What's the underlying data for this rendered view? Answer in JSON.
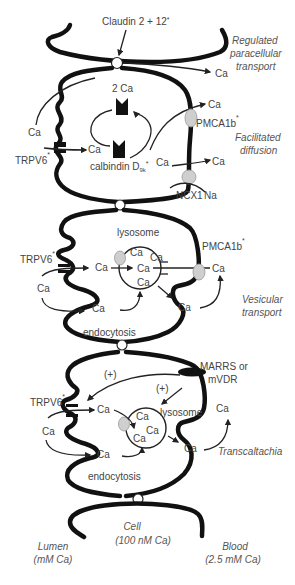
{
  "diagram": {
    "regions": {
      "lumen": {
        "label": "Lumen",
        "sub": "(mM Ca)"
      },
      "cell": {
        "label": "Cell",
        "sub": "(100 nM Ca)"
      },
      "blood": {
        "label": "Blood",
        "sub": "(2.5 mM Ca)"
      }
    },
    "pathways": [
      {
        "id": "paracellular",
        "label_line1": "Regulated",
        "label_line2": "paracellular",
        "label_line3": "transport"
      },
      {
        "id": "facilitated",
        "label_line1": "Facilitated",
        "label_line2": "diffusion"
      },
      {
        "id": "vesicular",
        "label_line1": "Vesicular",
        "label_line2": "transport"
      },
      {
        "id": "transcaltachia",
        "label_line1": "Transcaltachia"
      }
    ],
    "labels": {
      "claudin": "Claudin 2 + 12",
      "star": "*",
      "ca": "Ca",
      "two_ca": "2 Ca",
      "calbindin": "calbindin D",
      "calbindin_sub": "9k",
      "trpv6": "TRPV6",
      "pmca1b": "PMCA1b",
      "ncx1": "NCX1",
      "na": "Na",
      "lysosome": "lysosome",
      "endocytosis": "endocytosis",
      "marrs_line1": "MARRS or",
      "marrs_line2": "mVDR",
      "plus": "(+)"
    }
  }
}
